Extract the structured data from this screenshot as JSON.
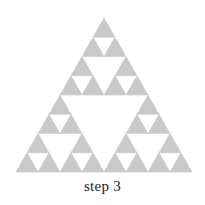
{
  "figure": {
    "caption": "step 3",
    "background_color": "#ffffff",
    "fill_color": "#c9c9c9",
    "caption_color": "#232323"
  },
  "chart_data": {
    "type": "diagram",
    "title": "step 3",
    "figure_kind": "sierpinski-triangle",
    "iteration": 3,
    "filled_triangle_count": 27,
    "base_subdivisions": 8,
    "fill_color": "#c9c9c9",
    "background_color": "#ffffff",
    "outer_triangle": {
      "apex_x": 104.0,
      "apex_y": 18.0,
      "left_x": 16.0,
      "right_x": 192.0,
      "base_y": 172.0,
      "width": 176.0,
      "height": 154.0
    },
    "unit_triangle": {
      "width": 22.0,
      "height": 19.25
    },
    "rows": [
      {
        "row": 0,
        "filled_columns": [
          0
        ]
      },
      {
        "row": 1,
        "filled_columns": [
          0,
          1
        ]
      },
      {
        "row": 2,
        "filled_columns": [
          0,
          2
        ]
      },
      {
        "row": 3,
        "filled_columns": [
          0,
          1,
          2,
          3
        ]
      },
      {
        "row": 4,
        "filled_columns": [
          0,
          4
        ]
      },
      {
        "row": 5,
        "filled_columns": [
          0,
          1,
          4,
          5
        ]
      },
      {
        "row": 6,
        "filled_columns": [
          0,
          2,
          4,
          6
        ]
      },
      {
        "row": 7,
        "filled_columns": [
          0,
          1,
          2,
          3,
          4,
          5,
          6,
          7
        ]
      }
    ],
    "xlabel": "",
    "ylabel": "",
    "grid": false,
    "legend": false
  }
}
